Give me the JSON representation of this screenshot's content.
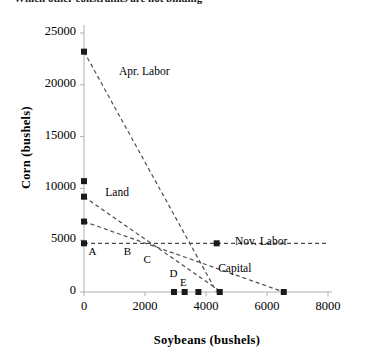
{
  "title": "Which other constraints are not binding",
  "chart_data": {
    "type": "scatter",
    "title": "Which other constraints are not binding",
    "xlabel": "Soybeans (bushels)",
    "ylabel": "Corn (bushels)",
    "xlim": [
      0,
      8000
    ],
    "ylim": [
      0,
      25000
    ],
    "xticks": [
      0,
      2000,
      4000,
      6000,
      8000
    ],
    "yticks": [
      0,
      5000,
      10000,
      15000,
      20000,
      25000
    ],
    "xtick_labels": [
      "0",
      "2000",
      "4000",
      "6000",
      "8000"
    ],
    "ytick_labels": [
      "0",
      "5000",
      "10000",
      "15000",
      "20000",
      "25000"
    ],
    "grid": false,
    "legend": "inline-annotations",
    "marker": "filled-square",
    "marker_color": "#1a1a1a",
    "line_style": "dashed",
    "line_color": "#4d4d4d",
    "constraints": [
      {
        "name": "Apr. Labor",
        "label": "Apr. Labor",
        "label_xy": [
          1150,
          21200
        ],
        "intercept_y": 23200,
        "intercept_x": 4350,
        "points": [
          [
            0,
            23200
          ],
          [
            4350,
            0
          ]
        ]
      },
      {
        "name": "Land",
        "label": "Land",
        "label_xy": [
          700,
          9600
        ],
        "intercept_y": 9200,
        "intercept_x": 4500,
        "points": [
          [
            0,
            9200
          ],
          [
            4500,
            0
          ]
        ]
      },
      {
        "name": "Capital",
        "label": "Capital",
        "label_xy": [
          4400,
          2200
        ],
        "intercept_y": 6800,
        "intercept_x": 6550,
        "points": [
          [
            0,
            6800
          ],
          [
            6550,
            0
          ]
        ]
      },
      {
        "name": "Nov. Labor",
        "label": "Nov. Labor",
        "label_xy": [
          4950,
          4850
        ],
        "intercept_y": 4700,
        "intercept_x": 8000,
        "points": [
          [
            0,
            4700
          ],
          [
            8000,
            4700
          ]
        ]
      }
    ],
    "data_points": [
      {
        "x": 0,
        "y": 23200
      },
      {
        "x": 0,
        "y": 10700
      },
      {
        "x": 0,
        "y": 9200
      },
      {
        "x": 0,
        "y": 6800
      },
      {
        "x": 0,
        "y": 4700
      },
      {
        "x": 4350,
        "y": 4700
      },
      {
        "x": 2950,
        "y": 0
      },
      {
        "x": 3300,
        "y": 0
      },
      {
        "x": 3750,
        "y": 0
      },
      {
        "x": 4450,
        "y": 0
      },
      {
        "x": 6550,
        "y": 0
      }
    ],
    "vertex_labels": [
      {
        "label": "A",
        "x": 150,
        "y": 3900
      },
      {
        "label": "B",
        "x": 1300,
        "y": 3900
      },
      {
        "label": "C",
        "x": 1950,
        "y": 3050
      },
      {
        "label": "D",
        "x": 2800,
        "y": 1750
      },
      {
        "label": "E",
        "x": 3150,
        "y": 900
      }
    ]
  }
}
